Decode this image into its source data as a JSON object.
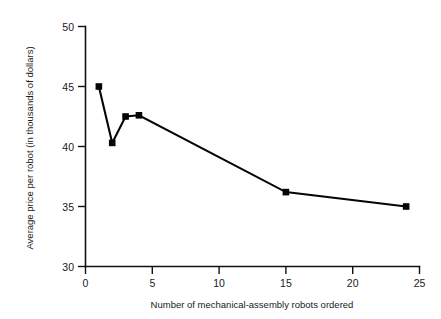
{
  "chart_data": {
    "type": "line",
    "title": "",
    "xlabel": "Number of mechanical-assembly robots ordered",
    "ylabel": "Average price per robot (in thousands of dollars)",
    "xlim": [
      0,
      25
    ],
    "ylim": [
      30,
      50
    ],
    "xticks": [
      0,
      5,
      10,
      15,
      20,
      25
    ],
    "yticks": [
      30,
      35,
      40,
      45,
      50
    ],
    "xtick_labels": [
      "0",
      "5",
      "10",
      "15",
      "20",
      "25"
    ],
    "ytick_labels": [
      "30",
      "35",
      "40",
      "45",
      "50"
    ],
    "grid": false,
    "legend": false,
    "marker": "square",
    "series": [
      {
        "name": "Average price per robot",
        "x": [
          1,
          2,
          3,
          4,
          15,
          24
        ],
        "values": [
          45.0,
          40.3,
          42.5,
          42.6,
          36.2,
          35.0
        ]
      }
    ]
  },
  "axes": {
    "y_axis_title": "Average price per robot (in thousands of dollars)",
    "x_axis_title": "Number of mechanical-assembly robots ordered"
  },
  "ticks": {
    "y": [
      "50",
      "45",
      "40",
      "35",
      "30"
    ],
    "x": [
      "0",
      "5",
      "10",
      "15",
      "20",
      "25"
    ]
  }
}
